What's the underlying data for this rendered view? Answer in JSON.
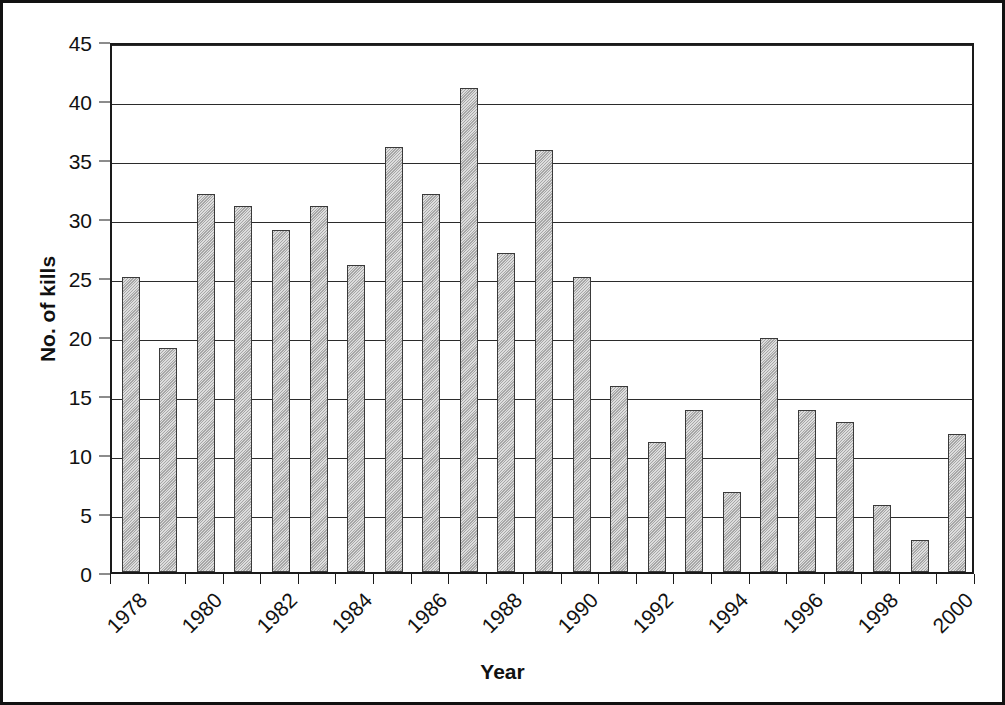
{
  "chart_data": {
    "type": "bar",
    "title": "",
    "xlabel": "Year",
    "ylabel": "No. of kills",
    "ylim": [
      0,
      45
    ],
    "ytick_step": 5,
    "yticks": [
      0,
      5,
      10,
      15,
      20,
      25,
      30,
      35,
      40,
      45
    ],
    "grid": true,
    "legend": "none",
    "xtick_labels_shown": [
      "1978",
      "1980",
      "1982",
      "1984",
      "1986",
      "1988",
      "1990",
      "1992",
      "1994",
      "1996",
      "1998",
      "2000"
    ],
    "xtick_label_rotation": -45,
    "categories": [
      "1978",
      "1979",
      "1980",
      "1981",
      "1982",
      "1983",
      "1984",
      "1985",
      "1986",
      "1987",
      "1988",
      "1989",
      "1990",
      "1991",
      "1992",
      "1993",
      "1994",
      "1995",
      "1996",
      "1997",
      "1998",
      "1999",
      "2000"
    ],
    "values": [
      25,
      19,
      32,
      31,
      29,
      31,
      26,
      36,
      32,
      41,
      27,
      35.8,
      25,
      15.8,
      11,
      13.7,
      6.8,
      19.8,
      13.7,
      12.7,
      5.7,
      2.7,
      11.7
    ],
    "bar_color": "#b3b3b3",
    "bar_edge_color": "#3a3a3a",
    "axis_color": "#1a1a1a",
    "frame_color": "#111111"
  }
}
